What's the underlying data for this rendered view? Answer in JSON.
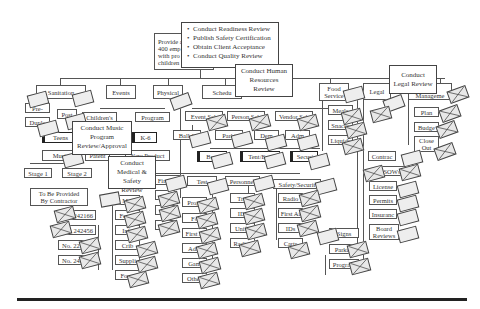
{
  "diagram": {
    "root": {
      "label": "Provide a 400 emp with pro children",
      "lines": [
        "Provide a",
        "400 emp",
        "with pro",
        "children"
      ]
    },
    "callouts": {
      "readiness": {
        "items": [
          "Conduct Readiness Review",
          "Publish Safety Certification",
          "Obtain Client Acceptance",
          "Conduct Quality Review"
        ]
      },
      "hr": {
        "lines": [
          "Conduct Human",
          "Resources",
          "Review"
        ]
      },
      "legal": {
        "lines": [
          "Conduct",
          "Legal Review"
        ]
      },
      "music": {
        "lines": [
          "Conduct Music",
          "Program",
          "Review/Approval"
        ]
      },
      "medical": {
        "lines": [
          "Conduct",
          "Medical &",
          "Safety Review"
        ]
      }
    },
    "branches": {
      "sanitation": "Sanitation",
      "events": "Events",
      "physical": "Physical",
      "schedule": "Schedu",
      "food_service": [
        "Food",
        "Service"
      ],
      "legal": "Legal",
      "management": "Manageme"
    },
    "nodes": {
      "pre": "Pre-",
      "post": "Post",
      "duplex": "Duple",
      "childrens": "Children's",
      "program": "Program",
      "teens": "Teens",
      "k6": "K-6",
      "music": "Musi",
      "patents": "Patent",
      "new_product": "New Product",
      "stage1": "Stage 1",
      "stage2": "Stage 2",
      "contractor": [
        "To Be Provided",
        "By Contractor"
      ],
      "no1": "242166",
      "no2": "b. 242456",
      "no3": "No. 22",
      "no4": "No. 242",
      "med_male": "Mal",
      "female": "Femal",
      "infant": "Infa",
      "crib": "Crib",
      "supplies": "Suppli",
      "forms": "Form",
      "financial": "Financi",
      "g1": "O",
      "g2": "E",
      "g3": "E",
      "event_sched": "Event Sch",
      "person_sched": "Person Sch",
      "vendor_sched": "Vendor Sch",
      "ballpark": "Ball-P",
      "parking": "Parki",
      "demo": "Dem",
      "admin": "Adm",
      "barriers": "Barri",
      "tent": "Tent/Equi",
      "security": "Securi",
      "test": "Test",
      "personnel": "Personnel",
      "safety_security": "Safety/Securit",
      "programs": "Progr",
      "food": "Fo",
      "first_aid_t": "First A",
      "admin_t": "Adm",
      "games": "Gam",
      "other": "Other",
      "training": "Trai",
      "ids_p": "IDs",
      "uniforms": "Unifo",
      "radios_p": "Radios",
      "radios_s": "Radio",
      "first_aid_s": "First Ai",
      "ids_s": "IDs",
      "carts": "Carts",
      "meals": "Meals",
      "snacks": "Snacks",
      "liquids": "Liquids",
      "signs": "Signs",
      "parking_s": "Parki",
      "program_s": "Program",
      "plan": "Plan",
      "budget": "Budge",
      "close_out": [
        "Close",
        "Out"
      ],
      "contracts": "Contrac",
      "sows": "SOWs",
      "licenses": "License",
      "permits": "Permits",
      "insurance": "Insuranc",
      "board_review": [
        "Board",
        "Reviews"
      ]
    }
  }
}
